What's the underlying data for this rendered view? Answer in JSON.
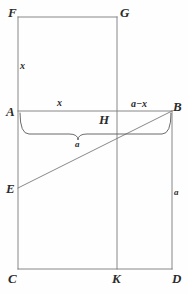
{
  "figure": {
    "stroke_color": "#7a7a7a",
    "text_color": "#2b2b2b",
    "background_color": "#fefefe",
    "stroke_width": 0.9,
    "vertices": [
      {
        "id": "F",
        "label": "F",
        "x": 18,
        "y": 17,
        "label_x": 8,
        "label_y": 6
      },
      {
        "id": "G",
        "label": "G",
        "x": 117,
        "y": 17,
        "label_x": 120,
        "label_y": 6
      },
      {
        "id": "A",
        "label": "A",
        "x": 18,
        "y": 111,
        "label_x": 6,
        "label_y": 105
      },
      {
        "id": "B",
        "label": "B",
        "x": 172,
        "y": 111,
        "label_x": 173,
        "label_y": 100
      },
      {
        "id": "H",
        "label": "H",
        "x": 105,
        "y": 120,
        "label_x": 99,
        "label_y": 113
      },
      {
        "id": "E",
        "label": "E",
        "x": 18,
        "y": 188,
        "label_x": 6,
        "label_y": 182
      },
      {
        "id": "C",
        "label": "C",
        "x": 18,
        "y": 269,
        "label_x": 8,
        "label_y": 272
      },
      {
        "id": "K",
        "label": "K",
        "x": 117,
        "y": 269,
        "label_x": 112,
        "label_y": 272
      },
      {
        "id": "D",
        "label": "D",
        "x": 172,
        "y": 269,
        "label_x": 172,
        "label_y": 272
      }
    ],
    "segments": [
      {
        "name": "segment-FG",
        "x1": 18,
        "y1": 17,
        "x2": 117,
        "y2": 17
      },
      {
        "name": "segment-FC",
        "x1": 18,
        "y1": 17,
        "x2": 18,
        "y2": 269
      },
      {
        "name": "segment-GK",
        "x1": 117,
        "y1": 17,
        "x2": 117,
        "y2": 269
      },
      {
        "name": "segment-AB",
        "x1": 18,
        "y1": 111,
        "x2": 172,
        "y2": 111
      },
      {
        "name": "segment-BD",
        "x1": 172,
        "y1": 111,
        "x2": 172,
        "y2": 269
      },
      {
        "name": "segment-CD",
        "x1": 18,
        "y1": 269,
        "x2": 172,
        "y2": 269
      },
      {
        "name": "segment-EB-diagonal",
        "x1": 18,
        "y1": 188,
        "x2": 172,
        "y2": 111
      }
    ],
    "brace": {
      "name": "brace-a",
      "left_x": 20,
      "right_x": 171,
      "top_y": 113,
      "bar_y": 134,
      "tip_x": 78,
      "tip_y": 140
    },
    "measures": [
      {
        "id": "x-left",
        "label": "x",
        "x": 20,
        "y": 61,
        "size": "normal"
      },
      {
        "id": "x-top",
        "label": "x",
        "x": 57,
        "y": 98,
        "size": "normal"
      },
      {
        "id": "a-minus-x",
        "label": "a−x",
        "x": 131,
        "y": 99,
        "size": "normal"
      },
      {
        "id": "a-brace",
        "label": "a",
        "x": 75,
        "y": 140,
        "size": "small"
      },
      {
        "id": "a-right",
        "label": "a",
        "x": 174,
        "y": 188,
        "size": "small"
      }
    ]
  }
}
